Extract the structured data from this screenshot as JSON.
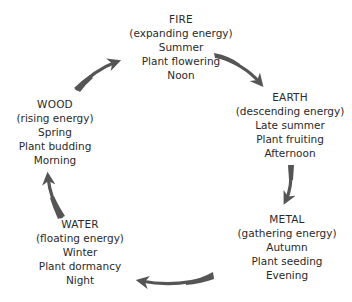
{
  "diagram": {
    "type": "cycle",
    "title": "",
    "arrow_color": "#555555",
    "nodes": [
      {
        "id": "fire",
        "name": "FIRE",
        "energy": "(expanding energy)",
        "season": "Summer",
        "plant_stage": "Plant flowering",
        "time_of_day": "Noon"
      },
      {
        "id": "earth",
        "name": "EARTH",
        "energy": "(descending energy)",
        "season": "Late summer",
        "plant_stage": "Plant fruiting",
        "time_of_day": "Afternoon"
      },
      {
        "id": "metal",
        "name": "METAL",
        "energy": "(gathering energy)",
        "season": "Autumn",
        "plant_stage": "Plant seeding",
        "time_of_day": "Evening"
      },
      {
        "id": "water",
        "name": "WATER",
        "energy": "(floating energy)",
        "season": "Winter",
        "plant_stage": "Plant dormancy",
        "time_of_day": "Night"
      },
      {
        "id": "wood",
        "name": "WOOD",
        "energy": "(rising energy)",
        "season": "Spring",
        "plant_stage": "Plant budding",
        "time_of_day": "Morning"
      }
    ],
    "edges": [
      {
        "from": "fire",
        "to": "earth"
      },
      {
        "from": "earth",
        "to": "metal"
      },
      {
        "from": "metal",
        "to": "water"
      },
      {
        "from": "water",
        "to": "wood"
      },
      {
        "from": "wood",
        "to": "fire"
      }
    ]
  }
}
